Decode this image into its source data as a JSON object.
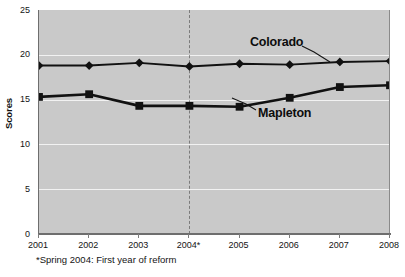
{
  "chart_data": {
    "type": "line",
    "title": "",
    "subtitle": "",
    "xlabel": "",
    "ylabel": "Scores",
    "x": [
      "2001",
      "2002",
      "2003",
      "2004*",
      "2005",
      "2006",
      "2007",
      "2008"
    ],
    "categories": [
      "2001",
      "2002",
      "2003",
      "2004*",
      "2005",
      "2006",
      "2007",
      "2008"
    ],
    "xtick_labels": [
      "2001",
      "2002",
      "2003",
      "2004*",
      "2005",
      "2006",
      "2007",
      "2008"
    ],
    "ytick_labels": [
      "0",
      "5",
      "10",
      "15",
      "20",
      "25"
    ],
    "ytick_values": [
      0,
      5,
      10,
      15,
      20,
      25
    ],
    "ylim": [
      0,
      25
    ],
    "grid": true,
    "grid_axis": "y",
    "legend_position": "inline-annotation",
    "series": [
      {
        "name": "Colorado",
        "marker": "diamond",
        "values": [
          18.8,
          18.8,
          19.1,
          18.7,
          19.0,
          18.9,
          19.2,
          19.3
        ]
      },
      {
        "name": "Mapleton",
        "marker": "square",
        "values": [
          15.3,
          15.6,
          14.3,
          14.3,
          14.2,
          15.2,
          16.4,
          16.6
        ]
      }
    ],
    "annotations": [
      {
        "name": "reform-marker",
        "type": "vline",
        "x": "2004*",
        "style": "dashed",
        "label": ""
      }
    ],
    "footnote": "*Spring 2004: First year of reform"
  },
  "colors": {
    "plot_background": "#c9c9c9",
    "gridline": "#f2f2f2",
    "series_line": "#111111",
    "axis": "#6e6e6e",
    "reform_line": "#7b7b7b",
    "text": "#141414",
    "page_background": "#ffffff"
  }
}
